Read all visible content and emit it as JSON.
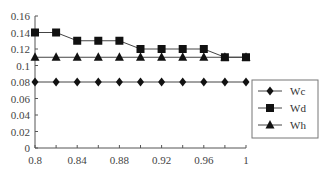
{
  "chart_data": {
    "type": "line",
    "title": "",
    "xlabel": "",
    "ylabel": "",
    "x": [
      0.8,
      0.82,
      0.84,
      0.86,
      0.88,
      0.9,
      0.92,
      0.94,
      0.96,
      0.98,
      1.0
    ],
    "series": [
      {
        "name": "Wc",
        "marker": "diamond",
        "values": [
          0.08,
          0.08,
          0.08,
          0.08,
          0.08,
          0.08,
          0.08,
          0.08,
          0.08,
          0.08,
          0.08
        ]
      },
      {
        "name": "Wd",
        "marker": "square",
        "values": [
          0.14,
          0.14,
          0.13,
          0.13,
          0.13,
          0.12,
          0.12,
          0.12,
          0.12,
          0.11,
          0.11
        ]
      },
      {
        "name": "Wh",
        "marker": "triangle",
        "values": [
          0.11,
          0.11,
          0.11,
          0.11,
          0.11,
          0.11,
          0.11,
          0.11,
          0.11,
          0.11,
          0.11
        ]
      }
    ],
    "xlim": [
      0.8,
      1.0
    ],
    "ylim": [
      0,
      0.16
    ],
    "x_ticks": [
      "0.8",
      "0.84",
      "0.88",
      "0.92",
      "0.96",
      "1"
    ],
    "y_ticks": [
      "0",
      "0.02",
      "0.04",
      "0.06",
      "0.08",
      "0.1",
      "0.12",
      "0.14",
      "0.16"
    ],
    "grid": false,
    "legend_position": "right",
    "colors": {
      "line": "#444444",
      "marker": "#111111",
      "axis": "#555555"
    }
  }
}
